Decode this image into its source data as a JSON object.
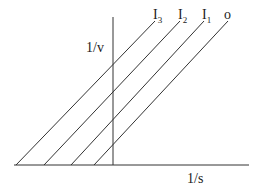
{
  "chart_data": {
    "type": "line",
    "title": "",
    "xlabel": "1/s",
    "ylabel": "1/v",
    "grid": false,
    "legend_position": "inline-top",
    "series": [
      {
        "name": "I3",
        "label_main": "I",
        "label_sub": "3",
        "x_intercept": -1.0,
        "points": [
          [
            16,
            165
          ],
          [
            155,
            21
          ]
        ]
      },
      {
        "name": "I2",
        "label_main": "I",
        "label_sub": "2",
        "x_intercept": -0.72,
        "points": [
          [
            44,
            165
          ],
          [
            180,
            21
          ]
        ]
      },
      {
        "name": "I1",
        "label_main": "I",
        "label_sub": "1",
        "x_intercept": -0.43,
        "points": [
          [
            71,
            165
          ],
          [
            204,
            21
          ]
        ]
      },
      {
        "name": "o",
        "label_main": "o",
        "label_sub": "",
        "x_intercept": -0.2,
        "points": [
          [
            94,
            165
          ],
          [
            228,
            21
          ]
        ]
      }
    ],
    "note": "Parallel lines (uncompetitive inhibition Lineweaver-Burk plot)"
  },
  "axes": {
    "x_label": "1/s",
    "y_label": "1/v",
    "color": "#333333"
  }
}
